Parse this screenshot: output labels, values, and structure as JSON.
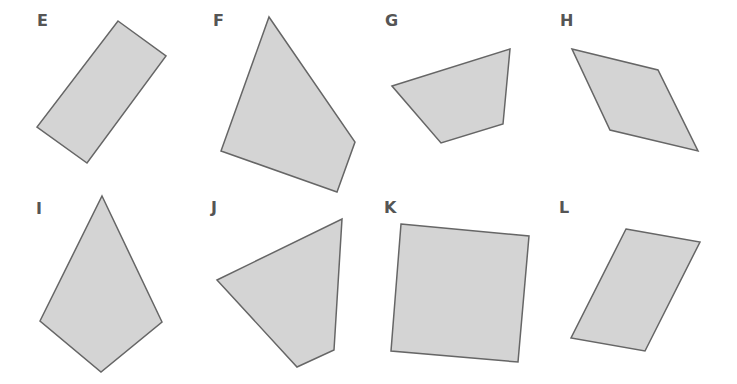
{
  "colors": {
    "fill": "#d4d4d4",
    "stroke": "#666666",
    "label": "#555555"
  },
  "shapes": [
    {
      "label": "E",
      "label_pos": [
        37,
        13
      ],
      "points": [
        [
          118,
          21
        ],
        [
          166,
          56
        ],
        [
          87,
          163
        ],
        [
          37,
          127
        ]
      ]
    },
    {
      "label": "F",
      "label_pos": [
        213,
        13
      ],
      "points": [
        [
          269,
          17
        ],
        [
          355,
          142
        ],
        [
          337,
          192
        ],
        [
          221,
          151
        ]
      ]
    },
    {
      "label": "G",
      "label_pos": [
        385,
        13
      ],
      "points": [
        [
          392,
          86
        ],
        [
          510,
          49
        ],
        [
          503,
          124
        ],
        [
          441,
          143
        ]
      ]
    },
    {
      "label": "H",
      "label_pos": [
        560,
        13
      ],
      "points": [
        [
          572,
          49
        ],
        [
          658,
          70
        ],
        [
          698,
          151
        ],
        [
          610,
          130
        ]
      ]
    },
    {
      "label": "I",
      "label_pos": [
        36,
        201
      ],
      "points": [
        [
          102,
          196
        ],
        [
          162,
          322
        ],
        [
          101,
          372
        ],
        [
          40,
          321
        ]
      ]
    },
    {
      "label": "J",
      "label_pos": [
        211,
        200
      ],
      "points": [
        [
          217,
          280
        ],
        [
          342,
          219
        ],
        [
          334,
          350
        ],
        [
          297,
          367
        ]
      ]
    },
    {
      "label": "K",
      "label_pos": [
        384,
        200
      ],
      "points": [
        [
          401,
          224
        ],
        [
          529,
          236
        ],
        [
          518,
          362
        ],
        [
          391,
          351
        ]
      ]
    },
    {
      "label": "L",
      "label_pos": [
        559,
        200
      ],
      "points": [
        [
          626,
          229
        ],
        [
          700,
          242
        ],
        [
          645,
          351
        ],
        [
          571,
          338
        ]
      ]
    }
  ]
}
